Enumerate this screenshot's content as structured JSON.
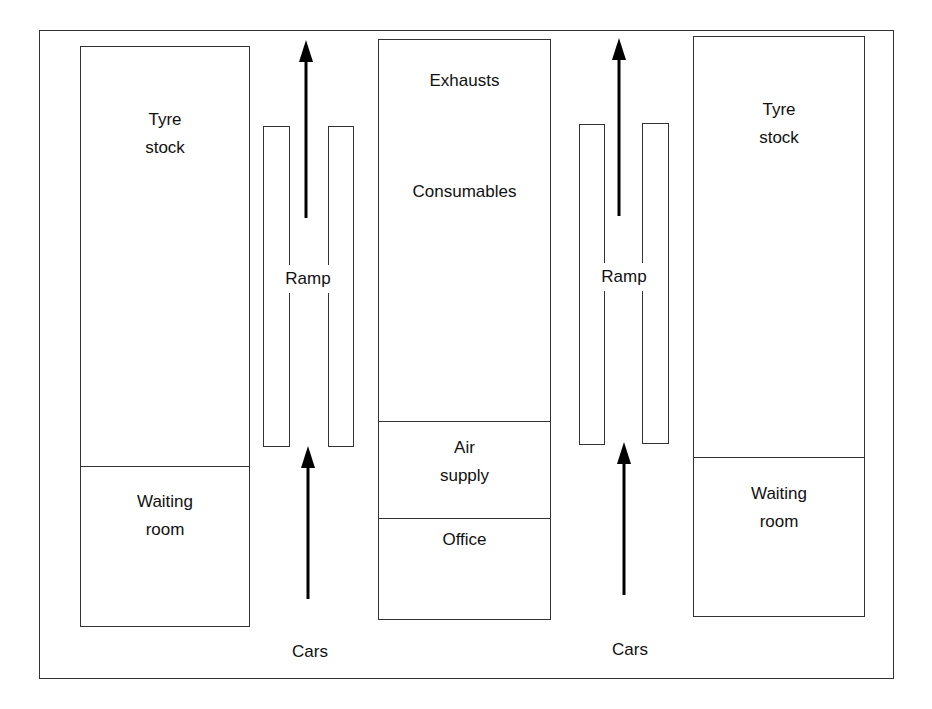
{
  "diagram": {
    "title": "",
    "left_block": {
      "top_label": "Tyre\nstock",
      "bottom_label": "Waiting\nroom"
    },
    "left_ramp": {
      "label": "Ramp"
    },
    "left_entry": {
      "label": "Cars"
    },
    "center_block": {
      "labels": [
        "Exhausts",
        "Consumables",
        "Air\nsupply",
        "Office"
      ]
    },
    "right_ramp": {
      "label": "Ramp"
    },
    "right_entry": {
      "label": "Cars"
    },
    "right_block": {
      "top_label": "Tyre\nstock",
      "bottom_label": "Waiting\nroom"
    },
    "colors": {
      "line": "#333333",
      "arrow": "#000000",
      "background": "#ffffff"
    }
  }
}
